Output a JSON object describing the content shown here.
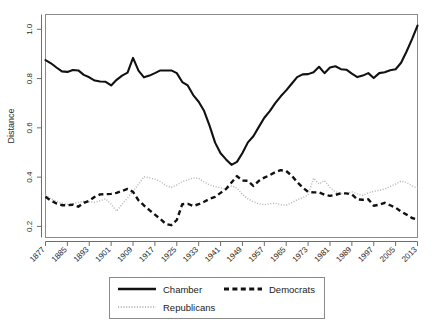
{
  "chart_data": {
    "type": "line",
    "title": "",
    "xlabel": "",
    "ylabel": "Distance",
    "xlim": [
      1877,
      2013
    ],
    "ylim": [
      0.155,
      1.06
    ],
    "grid": false,
    "legend_position": "bottom",
    "xticks": [
      1877,
      1885,
      1893,
      1901,
      1909,
      1917,
      1925,
      1933,
      1941,
      1949,
      1957,
      1965,
      1973,
      1981,
      1989,
      1997,
      2005,
      2013
    ],
    "yticks": [
      0.2,
      0.4,
      0.6,
      0.8,
      1.0
    ],
    "ytick_labels": [
      "0.2",
      "0.4",
      "0.6",
      "0.8",
      "1.0"
    ],
    "x": [
      1877,
      1879,
      1881,
      1883,
      1885,
      1887,
      1889,
      1891,
      1893,
      1895,
      1897,
      1899,
      1901,
      1903,
      1905,
      1907,
      1909,
      1911,
      1913,
      1915,
      1917,
      1919,
      1921,
      1923,
      1925,
      1927,
      1929,
      1931,
      1933,
      1935,
      1937,
      1939,
      1941,
      1943,
      1945,
      1947,
      1949,
      1951,
      1953,
      1955,
      1957,
      1959,
      1961,
      1963,
      1965,
      1967,
      1969,
      1971,
      1973,
      1975,
      1977,
      1979,
      1981,
      1983,
      1985,
      1987,
      1989,
      1991,
      1993,
      1995,
      1997,
      1999,
      2001,
      2003,
      2005,
      2007,
      2009,
      2011,
      2013
    ],
    "series": [
      {
        "name": "Chamber",
        "style": "solid",
        "color": "#111111",
        "values": [
          0.875,
          0.862,
          0.845,
          0.829,
          0.827,
          0.835,
          0.833,
          0.815,
          0.805,
          0.792,
          0.788,
          0.787,
          0.772,
          0.795,
          0.812,
          0.824,
          0.884,
          0.832,
          0.805,
          0.812,
          0.822,
          0.833,
          0.833,
          0.833,
          0.822,
          0.786,
          0.772,
          0.733,
          0.706,
          0.668,
          0.608,
          0.54,
          0.497,
          0.472,
          0.45,
          0.462,
          0.498,
          0.541,
          0.566,
          0.604,
          0.641,
          0.668,
          0.7,
          0.728,
          0.752,
          0.779,
          0.806,
          0.817,
          0.818,
          0.826,
          0.848,
          0.822,
          0.845,
          0.85,
          0.838,
          0.836,
          0.82,
          0.806,
          0.812,
          0.822,
          0.802,
          0.822,
          0.826,
          0.834,
          0.838,
          0.864,
          0.91,
          0.96,
          1.015
        ]
      },
      {
        "name": "Democrats",
        "style": "dashed",
        "color": "#111111",
        "values": [
          0.32,
          0.305,
          0.293,
          0.286,
          0.286,
          0.288,
          0.28,
          0.296,
          0.304,
          0.32,
          0.33,
          0.331,
          0.332,
          0.336,
          0.344,
          0.352,
          0.34,
          0.306,
          0.285,
          0.266,
          0.248,
          0.23,
          0.21,
          0.205,
          0.226,
          0.29,
          0.292,
          0.283,
          0.29,
          0.3,
          0.312,
          0.32,
          0.336,
          0.352,
          0.378,
          0.404,
          0.386,
          0.385,
          0.364,
          0.385,
          0.398,
          0.408,
          0.42,
          0.428,
          0.425,
          0.406,
          0.38,
          0.358,
          0.34,
          0.338,
          0.338,
          0.329,
          0.324,
          0.328,
          0.334,
          0.334,
          0.33,
          0.31,
          0.308,
          0.31,
          0.284,
          0.288,
          0.296,
          0.286,
          0.276,
          0.26,
          0.248,
          0.234,
          0.228
        ]
      },
      {
        "name": "Republicans",
        "style": "dotted",
        "color": "#bcbcbc",
        "values": [
          0.33,
          0.312,
          0.302,
          0.294,
          0.29,
          0.292,
          0.297,
          0.302,
          0.3,
          0.298,
          0.304,
          0.312,
          0.29,
          0.262,
          0.29,
          0.315,
          0.342,
          0.372,
          0.402,
          0.397,
          0.392,
          0.382,
          0.366,
          0.358,
          0.368,
          0.382,
          0.388,
          0.397,
          0.395,
          0.38,
          0.368,
          0.362,
          0.356,
          0.35,
          0.364,
          0.356,
          0.33,
          0.312,
          0.3,
          0.292,
          0.288,
          0.292,
          0.294,
          0.288,
          0.286,
          0.296,
          0.308,
          0.316,
          0.328,
          0.396,
          0.372,
          0.386,
          0.358,
          0.34,
          0.334,
          0.332,
          0.34,
          0.332,
          0.326,
          0.336,
          0.342,
          0.346,
          0.352,
          0.362,
          0.372,
          0.384,
          0.378,
          0.364,
          0.356
        ]
      }
    ]
  },
  "axes": {
    "ylabel": "Distance"
  },
  "legend": {
    "items": [
      {
        "label": "Chamber",
        "key": "chamber"
      },
      {
        "label": "Democrats",
        "key": "democrats"
      },
      {
        "label": "Republicans",
        "key": "republicans"
      }
    ]
  },
  "colors": {
    "chamber": "#111111",
    "democrats": "#111111",
    "republicans": "#bcbcbc",
    "frame": "#8a8a8a",
    "text": "#1a1a1a",
    "background": "#ffffff"
  }
}
